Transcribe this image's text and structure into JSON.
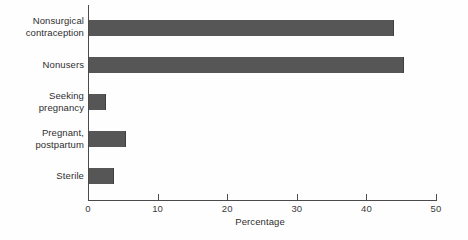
{
  "chart_data": {
    "type": "bar",
    "orientation": "horizontal",
    "title": "",
    "xlabel": "Percentage",
    "ylabel": "",
    "categories": [
      "Nonsurgical\ncontraception",
      "Nonusers",
      "Seeking\npregnancy",
      "Pregnant,\npostpartum",
      "Sterile"
    ],
    "values": [
      43.8,
      45.3,
      2.4,
      5.3,
      3.6
    ],
    "xlim": [
      0,
      50
    ],
    "xticks": [
      0,
      10,
      20,
      30,
      40,
      50
    ],
    "xtick_labels": [
      "0",
      "10",
      "20",
      "30",
      "40",
      "50"
    ],
    "grid": false,
    "legend": false,
    "bar_color": "#565656",
    "axis_color": "#4a4a4a",
    "background_color": "#fefefe"
  }
}
